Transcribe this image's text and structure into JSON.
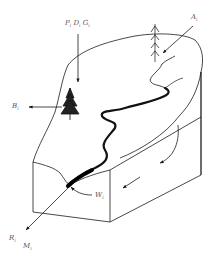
{
  "diagram": {
    "type": "watershed-block-diagram",
    "colors": {
      "line": "#1a1a1a",
      "background": "#ffffff",
      "label": "#555555"
    },
    "labels": {
      "precip": {
        "base": "P",
        "sub": "i"
      },
      "dep": {
        "base": "D",
        "sub": "i"
      },
      "gas": {
        "base": "G",
        "sub": "i"
      },
      "aerosol": {
        "base": "A",
        "sub": "i"
      },
      "biomass": {
        "base": "B",
        "sub": "i"
      },
      "weathering": {
        "base": "W",
        "sub": "i"
      },
      "runoff": {
        "base": "R",
        "sub": "i"
      },
      "mass": {
        "base": "M",
        "sub": "i"
      }
    },
    "arrows": [
      {
        "name": "inputs-PDG-down",
        "direction": "down"
      },
      {
        "name": "aerosol-in",
        "direction": "down-left"
      },
      {
        "name": "biomass-out",
        "direction": "left"
      },
      {
        "name": "weathering-to-outlet",
        "direction": "curved-left"
      },
      {
        "name": "outlet-flux",
        "direction": "down-left"
      },
      {
        "name": "subsurface-flow-1",
        "direction": "curved-down"
      },
      {
        "name": "subsurface-flow-2",
        "direction": "left"
      }
    ],
    "features": [
      "conifer-tree-large",
      "conifer-tree-small",
      "meandering-stream",
      "block-terrain"
    ]
  }
}
